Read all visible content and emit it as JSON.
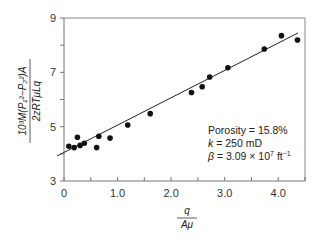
{
  "chart_data": {
    "type": "scatter",
    "title": "",
    "xlabel": "q / Aμ",
    "ylabel": "10³M(P₁² − P₂²)A / 2zRTμLq",
    "xlim": [
      0,
      4.5
    ],
    "ylim": [
      3,
      9
    ],
    "x_ticks": [
      0,
      0.5,
      1.0,
      1.5,
      2.0,
      2.5,
      3.0,
      3.5,
      4.0,
      4.5
    ],
    "x_tick_labels": [
      "0",
      "1.0",
      "2.0",
      "3.0",
      "4.0"
    ],
    "x_tick_label_values": [
      0,
      1.0,
      2.0,
      3.0,
      4.0
    ],
    "y_ticks": [
      3,
      4,
      5,
      6,
      7,
      8,
      9
    ],
    "y_tick_labels": [
      "3",
      "5",
      "7",
      "9"
    ],
    "y_tick_label_values": [
      3,
      5,
      7,
      9
    ],
    "grid": false,
    "series": [
      {
        "name": "measured",
        "type": "scatter",
        "x": [
          0.09,
          0.19,
          0.25,
          0.3,
          0.38,
          0.61,
          0.65,
          0.86,
          1.19,
          1.61,
          2.38,
          2.58,
          2.72,
          3.06,
          3.74,
          4.06,
          4.36
        ],
        "y": [
          4.28,
          4.23,
          4.61,
          4.31,
          4.39,
          4.23,
          4.65,
          4.58,
          5.06,
          5.48,
          6.26,
          6.47,
          6.83,
          7.17,
          7.86,
          8.35,
          8.19
        ]
      },
      {
        "name": "linear fit",
        "type": "line",
        "x": [
          -0.13,
          4.37
        ],
        "y": [
          3.92,
          8.45
        ]
      }
    ],
    "annotations": [
      "Porosity = 15.8%",
      "k = 250 mD",
      "β = 3.09 × 10⁷ ft⁻¹"
    ],
    "legend": null
  },
  "labels": {
    "x_num": "q",
    "x_den": "Aμ",
    "y_num": "10³M(P₁²−P₂²)A",
    "y_den": "2zRTμLq",
    "annot_porosity": "Porosity = 15.8%",
    "annot_k_sym": "k",
    "annot_k_val": " = 250 mD",
    "annot_beta_sym": "β",
    "annot_beta_val": " = 3.09 × 10",
    "annot_beta_exp": "7",
    "annot_beta_unit": " ft",
    "annot_beta_unit_exp": "−1"
  },
  "style": {
    "axis_color": "#777777",
    "point_color": "#111111",
    "line_color": "#222222"
  }
}
